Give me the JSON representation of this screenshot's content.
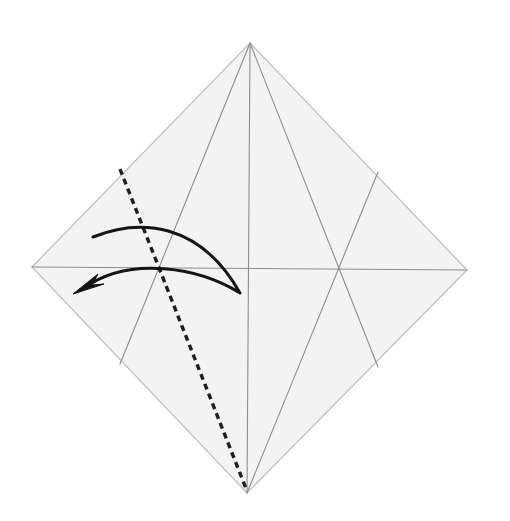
{
  "diagram": {
    "colors": {
      "background": "#ffffff",
      "paper": "#f3f3f3",
      "paper_edge": "#bdbdbd",
      "crease": "#8c8c8c",
      "valley_line": "#1e1e1e",
      "arrow": "#151515"
    },
    "paper": {
      "shape": "square-diamond",
      "vertices": {
        "top": [
          250,
          43
        ],
        "right": [
          467,
          270
        ],
        "bottom": [
          247,
          493
        ],
        "left": [
          32,
          267
        ]
      }
    },
    "creases": [
      {
        "name": "vertical-center-crease",
        "from": [
          250,
          43
        ],
        "to": [
          247,
          493
        ]
      },
      {
        "name": "horizontal-center-crease",
        "from": [
          32,
          267
        ],
        "to": [
          467,
          270
        ]
      },
      {
        "name": "left-diagonal-crease",
        "from": [
          250,
          43
        ],
        "to": [
          120,
          364
        ]
      },
      {
        "name": "right-diagonal-crease-upper",
        "from": [
          250,
          43
        ],
        "to": [
          378,
          367
        ]
      },
      {
        "name": "right-diagonal-crease-lower",
        "from": [
          247,
          493
        ],
        "to": [
          378,
          172
        ]
      }
    ],
    "valley_fold_line": {
      "from": [
        120,
        169
      ],
      "to": [
        247,
        493
      ],
      "style": "dashed"
    },
    "fold_arrow": {
      "start": [
        93,
        237
      ],
      "turn": [
        240,
        293
      ],
      "tip": [
        73,
        294
      ],
      "direction": "fold-left"
    }
  }
}
